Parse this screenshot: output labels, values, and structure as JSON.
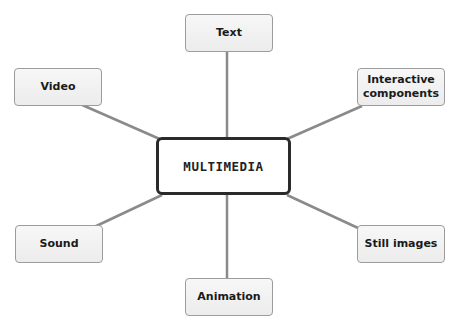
{
  "diagram": {
    "type": "mind-map",
    "center": {
      "label": "MULTIMEDIA"
    },
    "nodes": [
      {
        "id": "text",
        "label": "Text"
      },
      {
        "id": "interactive",
        "label": "Interactive components"
      },
      {
        "id": "still-images",
        "label": "Still images"
      },
      {
        "id": "animation",
        "label": "Animation"
      },
      {
        "id": "sound",
        "label": "Sound"
      },
      {
        "id": "video",
        "label": "Video"
      }
    ],
    "colors": {
      "connector": "#8a8a8a",
      "node_fill": "#eeeeee",
      "node_border": "#9c9c9c",
      "center_border": "#2a2a2a"
    }
  }
}
